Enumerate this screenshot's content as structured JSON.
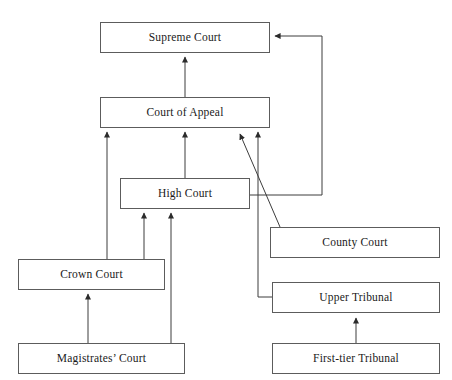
{
  "diagram": {
    "type": "flowchart",
    "background_color": "#ffffff",
    "box_border_color": "#5c5c5c",
    "edge_color": "#3c3c3c",
    "text_color": "#1a1a1a",
    "nodes": [
      {
        "id": "supreme-court",
        "label": "Supreme Court",
        "x": 100,
        "y": 22,
        "w": 170,
        "h": 31
      },
      {
        "id": "court-of-appeal",
        "label": "Court of Appeal",
        "x": 100,
        "y": 97,
        "w": 170,
        "h": 31
      },
      {
        "id": "high-court",
        "label": "High Court",
        "x": 120,
        "y": 178,
        "w": 130,
        "h": 31
      },
      {
        "id": "county-court",
        "label": "County Court",
        "x": 270,
        "y": 227,
        "w": 170,
        "h": 31
      },
      {
        "id": "crown-court",
        "label": "Crown Court",
        "x": 18,
        "y": 259,
        "w": 147,
        "h": 31
      },
      {
        "id": "upper-tribunal",
        "label": "Upper Tribunal",
        "x": 272,
        "y": 282,
        "w": 168,
        "h": 31
      },
      {
        "id": "magistrates-court",
        "label": "Magistrates’ Court",
        "x": 18,
        "y": 343,
        "w": 167,
        "h": 31
      },
      {
        "id": "first-tier-tribunal",
        "label": "First-tier Tribunal",
        "x": 272,
        "y": 343,
        "w": 168,
        "h": 31
      }
    ],
    "edges": [
      {
        "id": "court-of-appeal-to-supreme-court",
        "from": "court-of-appeal",
        "to": "supreme-court",
        "style": "straight-up"
      },
      {
        "id": "crown-court-to-court-of-appeal",
        "from": "crown-court",
        "to": "court-of-appeal",
        "style": "straight-up"
      },
      {
        "id": "high-court-to-court-of-appeal",
        "from": "high-court",
        "to": "court-of-appeal",
        "style": "straight-up"
      },
      {
        "id": "county-court-to-court-of-appeal",
        "from": "county-court",
        "to": "court-of-appeal",
        "style": "diagonal"
      },
      {
        "id": "upper-tribunal-to-court-of-appeal",
        "from": "upper-tribunal",
        "to": "court-of-appeal",
        "style": "elbow-left"
      },
      {
        "id": "high-court-to-supreme-court",
        "from": "high-court",
        "to": "supreme-court",
        "style": "elbow-right-leapfrog"
      },
      {
        "id": "magistrates-court-to-crown-court",
        "from": "magistrates-court",
        "to": "crown-court",
        "style": "straight-up"
      },
      {
        "id": "magistrates-court-to-high-court",
        "from": "magistrates-court",
        "to": "high-court",
        "style": "straight-up"
      },
      {
        "id": "crown-court-to-high-court",
        "from": "crown-court",
        "to": "high-court",
        "style": "straight-up"
      },
      {
        "id": "first-tier-tribunal-to-upper-tribunal",
        "from": "first-tier-tribunal",
        "to": "upper-tribunal",
        "style": "straight-up"
      }
    ]
  }
}
